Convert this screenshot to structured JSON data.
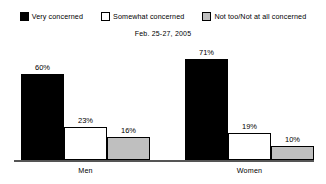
{
  "chart_data": {
    "type": "bar",
    "title": "",
    "subtitle": "Feb. 25-27, 2005",
    "xlabel": "",
    "ylabel": "",
    "ylim": [
      0,
      100
    ],
    "grid": false,
    "legend_position": "top",
    "categories": [
      "Men",
      "Women"
    ],
    "series": [
      {
        "name": "Very concerned",
        "color": "#000000",
        "values": [
          60,
          71
        ],
        "labels": [
          "60%",
          "71%"
        ]
      },
      {
        "name": "Somewhat concerned",
        "color": "#ffffff",
        "values": [
          23,
          19
        ],
        "labels": [
          "23%",
          "19%"
        ]
      },
      {
        "name": "Not too/Not at all concerned",
        "color": "#bfbfbf",
        "values": [
          16,
          10
        ],
        "labels": [
          "16%",
          "10%"
        ]
      }
    ]
  },
  "legend": {
    "items": [
      {
        "label": "Very concerned",
        "swatch": "black-swatch-icon"
      },
      {
        "label": "Somewhat concerned",
        "swatch": "white-swatch-icon"
      },
      {
        "label": "Not too/Not at all concerned",
        "swatch": "gray-swatch-icon"
      }
    ]
  },
  "subtitle": "Feb. 25-27, 2005",
  "axis": {
    "categories": [
      "Men",
      "Women"
    ]
  },
  "groups": [
    {
      "name": "Men",
      "bars": [
        {
          "label": "60%",
          "value": 60
        },
        {
          "label": "23%",
          "value": 23
        },
        {
          "label": "16%",
          "value": 16
        }
      ]
    },
    {
      "name": "Women",
      "bars": [
        {
          "label": "71%",
          "value": 71
        },
        {
          "label": "19%",
          "value": 19
        },
        {
          "label": "10%",
          "value": 10
        }
      ]
    }
  ]
}
